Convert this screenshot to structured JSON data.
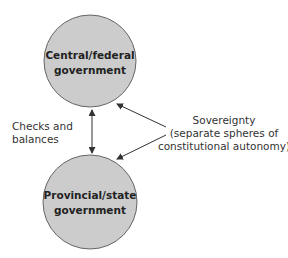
{
  "diagram": {
    "nodes": [
      {
        "id": "central",
        "line1": "Central/federal",
        "line2": "government"
      },
      {
        "id": "provincial",
        "line1": "Provincial/state",
        "line2": "government"
      }
    ],
    "left_label": {
      "line1": "Checks and",
      "line2": "balances"
    },
    "right_label": {
      "line1": "Sovereignty",
      "line2": "(separate spheres of",
      "line3": "constitutional autonomy)"
    },
    "colors": {
      "node_fill": "#cccccc",
      "node_stroke": "#555555",
      "arrow": "#444444"
    }
  }
}
